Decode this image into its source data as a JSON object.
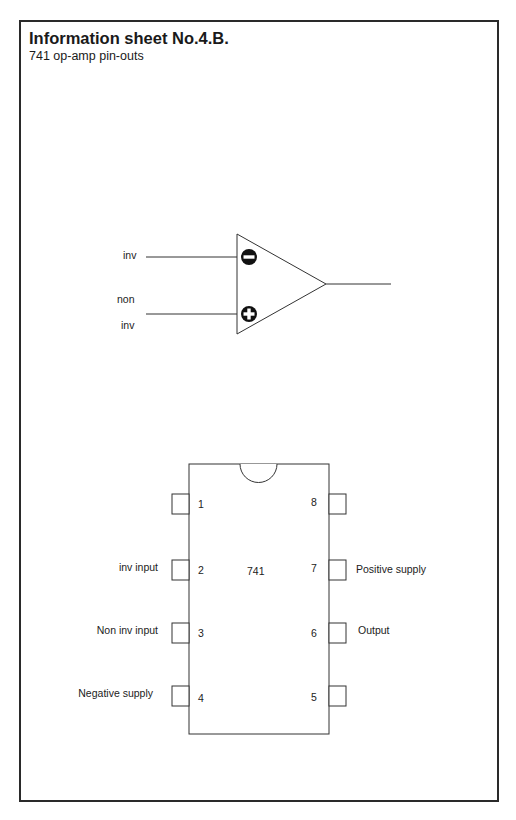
{
  "header": {
    "title": "Information sheet No.4.B.",
    "subtitle": "741 op-amp pin-outs"
  },
  "opamp_symbol": {
    "inputs": [
      {
        "label": "inv",
        "sign": "minus"
      },
      {
        "label_line1": "non",
        "label_line2": "inv",
        "sign": "plus"
      }
    ],
    "output": "output line"
  },
  "chip": {
    "name": "741",
    "pins": [
      {
        "number": "1",
        "label": ""
      },
      {
        "number": "2",
        "label": "inv input"
      },
      {
        "number": "3",
        "label": "Non inv input"
      },
      {
        "number": "4",
        "label": "Negative supply"
      },
      {
        "number": "5",
        "label": ""
      },
      {
        "number": "6",
        "label": "Output"
      },
      {
        "number": "7",
        "label": "Positive supply"
      },
      {
        "number": "8",
        "label": ""
      }
    ]
  }
}
